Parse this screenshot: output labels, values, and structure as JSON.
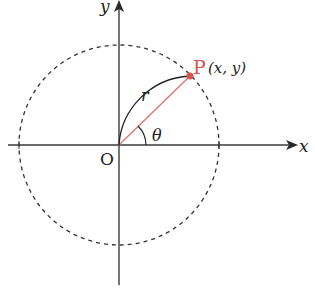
{
  "diagram": {
    "labels": {
      "x_axis": "x",
      "y_axis": "y",
      "origin": "O",
      "radius": "r",
      "angle": "θ",
      "point_name": "P",
      "point_coords": "(x, y)"
    },
    "colors": {
      "axis": "#3a3a3a",
      "circle": "#333333",
      "radius_line": "#e07070",
      "point": "#d9544a",
      "point_label": "#d9544a",
      "text": "#222222"
    },
    "geometry": {
      "origin": [
        119,
        145
      ],
      "circle_radius": 100,
      "point": [
        190,
        76
      ],
      "angle_deg": 44
    }
  }
}
